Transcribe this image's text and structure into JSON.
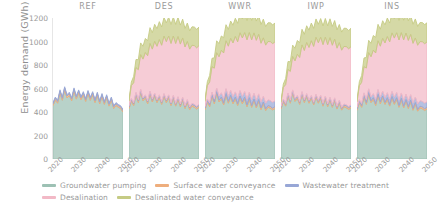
{
  "chart_data": {
    "type": "area",
    "title": "",
    "subtitle": "",
    "xlabel": "",
    "ylabel": "Energy demand (GWh)",
    "ylim": [
      0,
      1200
    ],
    "yticks": [
      0,
      200,
      400,
      600,
      800,
      1000,
      1200
    ],
    "ytick_labels": [
      "0",
      "200",
      "400",
      "600",
      "800",
      "1000",
      "1200"
    ],
    "xlim": [
      2020,
      2050
    ],
    "xticks": [
      2020,
      2030,
      2040,
      2050
    ],
    "xtick_labels": [
      "2020",
      "2030",
      "2040",
      "2050"
    ],
    "grid": false,
    "stacked": true,
    "legend_position": "bottom",
    "facet_titles": [
      "REF",
      "DES",
      "WWR",
      "IWP",
      "INS"
    ],
    "series": [
      {
        "name": "Groundwater pumping",
        "color": "#9dc1b4"
      },
      {
        "name": "Surface water conveyance",
        "color": "#eeae7d"
      },
      {
        "name": "Wastewater treatment",
        "color": "#98a7d6"
      },
      {
        "name": "Desalination",
        "color": "#f2b9c6"
      },
      {
        "name": "Desalinated water conveyance",
        "color": "#c5cb84"
      }
    ],
    "x": [
      2020,
      2021,
      2022,
      2023,
      2024,
      2025,
      2026,
      2027,
      2028,
      2029,
      2030,
      2031,
      2032,
      2033,
      2034,
      2035,
      2036,
      2037,
      2038,
      2039,
      2040,
      2041,
      2042,
      2043,
      2044,
      2045,
      2046,
      2047,
      2048,
      2049,
      2050
    ],
    "panels": [
      {
        "name": "REF",
        "series": {
          "Groundwater pumping": [
            455,
            500,
            475,
            560,
            500,
            585,
            520,
            540,
            495,
            575,
            510,
            560,
            505,
            545,
            490,
            555,
            500,
            545,
            480,
            540,
            470,
            530,
            465,
            520,
            450,
            500,
            430,
            455,
            440,
            430,
            400
          ],
          "Surface water conveyance": [
            15,
            16,
            15,
            17,
            16,
            18,
            16,
            17,
            16,
            18,
            16,
            17,
            16,
            17,
            15,
            17,
            16,
            17,
            15,
            17,
            15,
            16,
            15,
            16,
            15,
            16,
            14,
            15,
            14,
            14,
            13
          ],
          "Wastewater treatment": [
            10,
            11,
            10,
            12,
            11,
            12,
            11,
            11,
            10,
            12,
            11,
            11,
            10,
            11,
            10,
            11,
            10,
            11,
            10,
            11,
            10,
            11,
            10,
            11,
            10,
            11,
            9,
            10,
            10,
            9,
            9
          ],
          "Desalination": [
            0,
            0,
            0,
            0,
            0,
            0,
            0,
            0,
            0,
            0,
            0,
            0,
            0,
            0,
            0,
            0,
            0,
            0,
            0,
            0,
            0,
            0,
            0,
            0,
            0,
            0,
            0,
            0,
            0,
            0,
            0
          ],
          "Desalinated water conveyance": [
            0,
            0,
            0,
            0,
            0,
            0,
            0,
            0,
            0,
            0,
            0,
            0,
            0,
            0,
            0,
            0,
            0,
            0,
            0,
            0,
            0,
            0,
            0,
            0,
            0,
            0,
            0,
            0,
            0,
            0,
            0
          ]
        }
      },
      {
        "name": "DES",
        "series": {
          "Groundwater pumping": [
            430,
            490,
            455,
            540,
            480,
            565,
            495,
            520,
            470,
            550,
            485,
            535,
            480,
            520,
            465,
            530,
            480,
            520,
            455,
            515,
            450,
            505,
            445,
            500,
            430,
            480,
            420,
            450,
            440,
            425,
            440
          ],
          "Surface water conveyance": [
            14,
            15,
            14,
            16,
            15,
            17,
            15,
            16,
            15,
            17,
            15,
            16,
            15,
            16,
            14,
            16,
            15,
            16,
            14,
            16,
            14,
            15,
            14,
            15,
            14,
            15,
            14,
            14,
            15,
            14,
            15
          ],
          "Wastewater treatment": [
            9,
            10,
            9,
            11,
            10,
            11,
            10,
            10,
            9,
            11,
            10,
            10,
            9,
            10,
            9,
            10,
            9,
            10,
            9,
            10,
            9,
            10,
            9,
            10,
            9,
            10,
            9,
            9,
            10,
            9,
            10
          ],
          "Desalination": [
            40,
            110,
            170,
            210,
            255,
            295,
            330,
            360,
            385,
            405,
            425,
            440,
            455,
            470,
            480,
            490,
            495,
            500,
            505,
            505,
            510,
            512,
            510,
            505,
            500,
            495,
            492,
            495,
            500,
            498,
            500
          ],
          "Desalinated water conveyance": [
            10,
            30,
            55,
            70,
            85,
            100,
            110,
            120,
            128,
            135,
            140,
            145,
            150,
            153,
            156,
            158,
            160,
            161,
            162,
            162,
            163,
            163,
            162,
            160,
            158,
            157,
            156,
            157,
            158,
            158,
            158
          ]
        }
      },
      {
        "name": "WWR",
        "series": {
          "Groundwater pumping": [
            420,
            480,
            445,
            530,
            470,
            555,
            485,
            510,
            460,
            540,
            475,
            525,
            470,
            510,
            455,
            520,
            470,
            510,
            445,
            505,
            440,
            495,
            435,
            490,
            420,
            470,
            412,
            440,
            432,
            418,
            430
          ],
          "Surface water conveyance": [
            14,
            15,
            14,
            16,
            15,
            17,
            15,
            16,
            15,
            17,
            15,
            16,
            15,
            16,
            14,
            16,
            15,
            16,
            14,
            16,
            14,
            15,
            14,
            15,
            14,
            15,
            14,
            14,
            15,
            14,
            15
          ],
          "Wastewater treatment": [
            12,
            16,
            20,
            24,
            28,
            32,
            35,
            37,
            39,
            41,
            42,
            43,
            44,
            45,
            46,
            46,
            47,
            47,
            48,
            48,
            48,
            49,
            49,
            49,
            49,
            49,
            49,
            49,
            50,
            50,
            50
          ],
          "Desalination": [
            45,
            115,
            175,
            215,
            260,
            300,
            335,
            362,
            388,
            408,
            428,
            443,
            458,
            472,
            482,
            492,
            498,
            502,
            507,
            507,
            512,
            514,
            512,
            507,
            502,
            497,
            494,
            497,
            502,
            500,
            502
          ],
          "Desalinated water conveyance": [
            12,
            32,
            57,
            72,
            88,
            102,
            112,
            122,
            130,
            137,
            142,
            147,
            152,
            155,
            158,
            160,
            162,
            163,
            164,
            164,
            165,
            165,
            164,
            162,
            160,
            159,
            158,
            159,
            160,
            160,
            160
          ]
        }
      },
      {
        "name": "IWP",
        "series": {
          "Groundwater pumping": [
            425,
            485,
            450,
            535,
            475,
            560,
            490,
            515,
            465,
            545,
            480,
            530,
            475,
            515,
            460,
            525,
            475,
            515,
            450,
            510,
            445,
            500,
            440,
            495,
            425,
            475,
            416,
            445,
            436,
            422,
            436
          ],
          "Surface water conveyance": [
            14,
            15,
            14,
            16,
            15,
            17,
            15,
            16,
            15,
            17,
            15,
            16,
            15,
            16,
            14,
            16,
            15,
            16,
            14,
            16,
            14,
            15,
            14,
            15,
            14,
            15,
            14,
            14,
            15,
            14,
            15
          ],
          "Wastewater treatment": [
            9,
            10,
            9,
            11,
            10,
            11,
            10,
            10,
            9,
            11,
            10,
            10,
            9,
            10,
            9,
            10,
            9,
            10,
            9,
            10,
            9,
            10,
            9,
            10,
            9,
            10,
            9,
            9,
            10,
            9,
            10
          ],
          "Desalination": [
            35,
            100,
            160,
            200,
            245,
            285,
            320,
            350,
            375,
            398,
            418,
            435,
            450,
            465,
            475,
            485,
            490,
            495,
            500,
            500,
            505,
            507,
            505,
            500,
            495,
            490,
            487,
            490,
            495,
            493,
            495
          ],
          "Desalinated water conveyance": [
            9,
            28,
            52,
            68,
            82,
            96,
            108,
            118,
            126,
            133,
            138,
            143,
            148,
            151,
            154,
            156,
            158,
            159,
            160,
            160,
            161,
            161,
            160,
            158,
            156,
            155,
            154,
            155,
            156,
            156,
            156
          ]
        }
      },
      {
        "name": "INS",
        "series": {
          "Groundwater pumping": [
            415,
            475,
            440,
            525,
            465,
            550,
            480,
            505,
            455,
            535,
            470,
            520,
            465,
            505,
            450,
            515,
            465,
            505,
            440,
            500,
            435,
            490,
            430,
            485,
            415,
            465,
            407,
            435,
            427,
            413,
            425
          ],
          "Surface water conveyance": [
            14,
            15,
            14,
            16,
            15,
            17,
            15,
            16,
            15,
            17,
            15,
            16,
            15,
            16,
            14,
            16,
            15,
            16,
            14,
            16,
            14,
            15,
            14,
            15,
            14,
            15,
            14,
            14,
            15,
            14,
            15
          ],
          "Wastewater treatment": [
            11,
            14,
            18,
            22,
            26,
            30,
            33,
            35,
            37,
            39,
            40,
            41,
            42,
            43,
            44,
            44,
            45,
            45,
            46,
            46,
            46,
            47,
            47,
            47,
            47,
            47,
            47,
            47,
            48,
            48,
            48
          ],
          "Desalination": [
            48,
            120,
            180,
            222,
            268,
            308,
            342,
            370,
            395,
            415,
            435,
            450,
            465,
            478,
            488,
            498,
            504,
            508,
            513,
            513,
            518,
            520,
            518,
            513,
            508,
            503,
            500,
            503,
            508,
            506,
            508
          ],
          "Desalinated water conveyance": [
            13,
            34,
            59,
            75,
            90,
            105,
            115,
            125,
            133,
            140,
            145,
            150,
            155,
            158,
            161,
            163,
            165,
            166,
            167,
            167,
            168,
            168,
            167,
            165,
            163,
            162,
            161,
            162,
            163,
            163,
            163
          ]
        }
      }
    ]
  }
}
